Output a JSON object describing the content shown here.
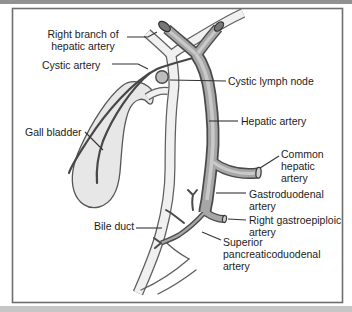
{
  "diagram": {
    "labels": {
      "right_branch_of_hepatic_artery": [
        "Right branch of",
        "hepatic artery"
      ],
      "cystic_artery": [
        "Cystic artery"
      ],
      "cystic_lymph_node": [
        "Cystic lymph node"
      ],
      "gall_bladder": [
        "Gall bladder"
      ],
      "hepatic_artery": [
        "Hepatic artery"
      ],
      "common_hepatic_artery": [
        "Common",
        "hepatic",
        "artery"
      ],
      "gastroduodenal_artery": [
        "Gastroduodenal",
        "artery"
      ],
      "right_gastroepiploic_artery": [
        "Right gastroepiploic",
        "artery"
      ],
      "superior_pancreaticoduodenal_artery": [
        "Superior",
        "pancreaticoduodenal",
        "artery"
      ],
      "bile_duct": [
        "Bile duct"
      ]
    },
    "colors": {
      "artery_outline": "#4a4a4a",
      "artery_fill": "#a6a6a6",
      "artery_highlight": "#c9c9c9",
      "duct_outline": "#5f5f5f",
      "duct_fill": "#f0f0f0",
      "gall_bladder_fill": "#e7e7e7",
      "leader_line": "#333333",
      "label_text": "#1c1c1c",
      "frame_border": "#6e6e6e",
      "top_strip": "#919191",
      "bottom_strip": "#c6c6c6"
    }
  }
}
